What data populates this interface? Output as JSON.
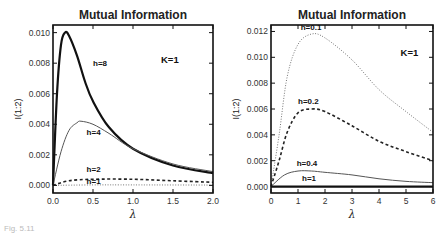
{
  "chart_data": [
    {
      "type": "line",
      "title": "Mutual Information",
      "xlabel": "λ",
      "ylabel": "I(1:2)",
      "xlim": [
        0,
        2.0
      ],
      "ylim": [
        -0.0005,
        0.0105
      ],
      "xticks": [
        "0.0",
        "0.5",
        "1.0",
        "1.5",
        "2.0"
      ],
      "yticks": [
        "0.000",
        "0.002",
        "0.004",
        "0.006",
        "0.008",
        "0.010"
      ],
      "annotation": "K=1",
      "grid": false,
      "series": [
        {
          "name": "h=8",
          "style": "thick-solid",
          "x": [
            0,
            0.05,
            0.1,
            0.15,
            0.2,
            0.3,
            0.4,
            0.5,
            0.7,
            1.0,
            1.5,
            2.0
          ],
          "values": [
            0,
            0.006,
            0.0092,
            0.01,
            0.0098,
            0.0085,
            0.0068,
            0.0055,
            0.0038,
            0.0024,
            0.0013,
            0.0008
          ]
        },
        {
          "name": "h=4",
          "style": "thin-solid",
          "x": [
            0,
            0.1,
            0.2,
            0.3,
            0.35,
            0.5,
            0.7,
            1.0,
            1.5,
            2.0
          ],
          "values": [
            0,
            0.0022,
            0.0036,
            0.0041,
            0.0042,
            0.004,
            0.0034,
            0.0024,
            0.0014,
            0.0009
          ]
        },
        {
          "name": "h=2",
          "style": "dashed",
          "x": [
            0,
            0.2,
            0.5,
            1.0,
            1.5,
            2.0
          ],
          "values": [
            0,
            0.0003,
            0.0004,
            0.0004,
            0.0003,
            0.0002
          ]
        },
        {
          "name": "h=1",
          "style": "dotted",
          "x": [
            0,
            0.5,
            1.0,
            2.0
          ],
          "values": [
            0,
            3e-05,
            3e-05,
            2e-05
          ]
        }
      ]
    },
    {
      "type": "line",
      "title": "Mutual Information",
      "xlabel": "λ",
      "ylabel": "I(1:2)",
      "xlim": [
        0,
        6
      ],
      "ylim": [
        -0.0005,
        0.0125
      ],
      "xticks": [
        "0",
        "1",
        "2",
        "3",
        "4",
        "5",
        "6"
      ],
      "yticks": [
        "0.000",
        "0.002",
        "0.004",
        "0.006",
        "0.008",
        "0.010",
        "0.012"
      ],
      "annotation": "K=1",
      "grid": false,
      "series": [
        {
          "name": "h=0.1",
          "style": "dotted",
          "x": [
            0,
            0.3,
            0.6,
            1.0,
            1.5,
            2.0,
            3.0,
            4.0,
            5.0,
            6.0
          ],
          "values": [
            0,
            0.004,
            0.0085,
            0.011,
            0.0118,
            0.0115,
            0.0098,
            0.0075,
            0.0058,
            0.0042
          ]
        },
        {
          "name": "h=0.2",
          "style": "dashed",
          "x": [
            0,
            0.3,
            0.6,
            1.0,
            1.5,
            2.0,
            3.0,
            4.0,
            5.0,
            6.0
          ],
          "values": [
            0,
            0.002,
            0.0042,
            0.0057,
            0.006,
            0.0058,
            0.0047,
            0.0035,
            0.0027,
            0.002
          ]
        },
        {
          "name": "h=0.4",
          "style": "thin-solid",
          "x": [
            0,
            0.5,
            1.0,
            1.5,
            2.0,
            3.0,
            4.0,
            5.0,
            6.0
          ],
          "values": [
            0,
            0.0009,
            0.0012,
            0.0012,
            0.0011,
            0.0009,
            0.0006,
            0.0004,
            0.0003
          ]
        },
        {
          "name": "h=1",
          "style": "thick-solid",
          "x": [
            0,
            6
          ],
          "values": [
            0,
            0
          ]
        }
      ]
    }
  ],
  "caption": "Fig. 5.11"
}
